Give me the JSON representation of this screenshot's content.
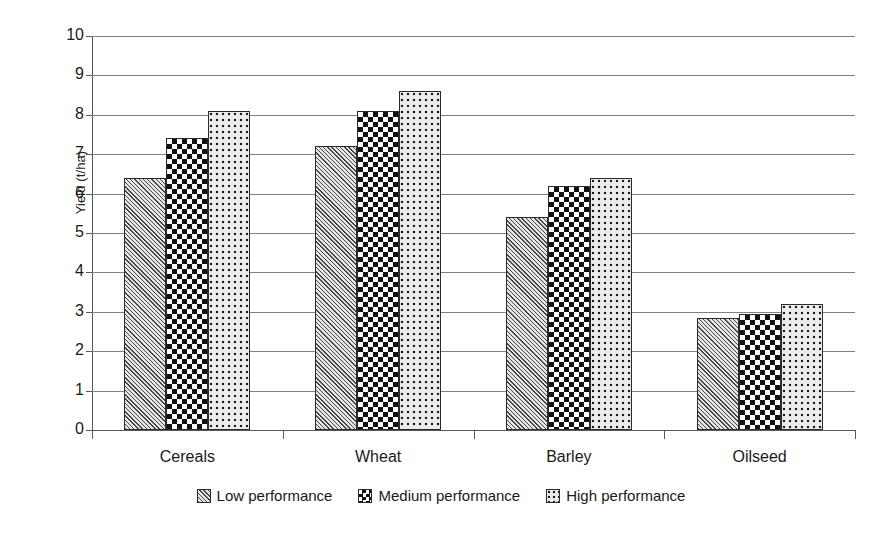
{
  "chart_data": {
    "type": "bar",
    "title": "",
    "xlabel": "",
    "ylabel": "Yield (t/ha)",
    "ylim": [
      0,
      10
    ],
    "ytick_step": 1,
    "yticks": [
      "10",
      "9",
      "8",
      "7",
      "6",
      "5",
      "4",
      "3",
      "2",
      "1",
      "0"
    ],
    "grid": true,
    "legend_position": "bottom",
    "categories": [
      "Cereals",
      "Wheat",
      "Barley",
      "Oilseed"
    ],
    "series": [
      {
        "name": "Low performance",
        "pattern": "diagonal-hatch",
        "values": [
          6.4,
          7.2,
          5.4,
          2.85
        ]
      },
      {
        "name": "Medium performance",
        "pattern": "checkerboard",
        "values": [
          7.4,
          8.1,
          6.2,
          2.95
        ]
      },
      {
        "name": "High performance",
        "pattern": "dotted",
        "values": [
          8.1,
          8.6,
          6.4,
          3.2
        ]
      }
    ],
    "colors": {
      "axis": "#595959",
      "gridline": "#808080",
      "bar_outline": "#2b2b2b",
      "low_fill": "#9d9d9d",
      "medium_fill": "#ffffff",
      "high_fill": "#ececec",
      "text": "#1a1a1a",
      "background": "#ffffff"
    }
  }
}
